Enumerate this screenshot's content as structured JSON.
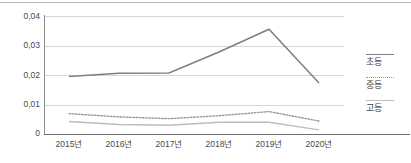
{
  "chart_data": {
    "type": "line",
    "title": "",
    "xlabel": "",
    "ylabel": "",
    "categories": [
      "2015년",
      "2016년",
      "2017년",
      "2018년",
      "2019년",
      "2020년"
    ],
    "ylim": [
      0,
      0.04
    ],
    "yticks": [
      0,
      0.01,
      0.02,
      0.03,
      0.04
    ],
    "ytick_labels": [
      "0",
      "0,01",
      "0,02",
      "0,03",
      "0,04"
    ],
    "grid": true,
    "legend_position": "right",
    "series": [
      {
        "name": "초등",
        "style": "solid",
        "color": "#7f7f7f",
        "values": [
          0.0195,
          0.0206,
          0.0207,
          0.0278,
          0.0355,
          0.0173
        ]
      },
      {
        "name": "중등",
        "style": "dotted",
        "color": "#9a9a9a",
        "values": [
          0.0069,
          0.0058,
          0.0052,
          0.0062,
          0.0076,
          0.0044
        ]
      },
      {
        "name": "고등",
        "style": "solid",
        "color": "#bdbdbd",
        "values": [
          0.0042,
          0.0032,
          0.003,
          0.004,
          0.004,
          0.0014
        ]
      }
    ]
  },
  "legend": {
    "items": [
      {
        "label": "초등"
      },
      {
        "label": "중등"
      },
      {
        "label": "고등"
      }
    ]
  },
  "colors": {
    "chodeung": "#7f7f7f",
    "jungdeung": "#9a9a9a",
    "godeung": "#bdbdbd",
    "grid": "#d6d6d6",
    "axis": "#6f6f6f",
    "text": "#4a4a4a"
  }
}
